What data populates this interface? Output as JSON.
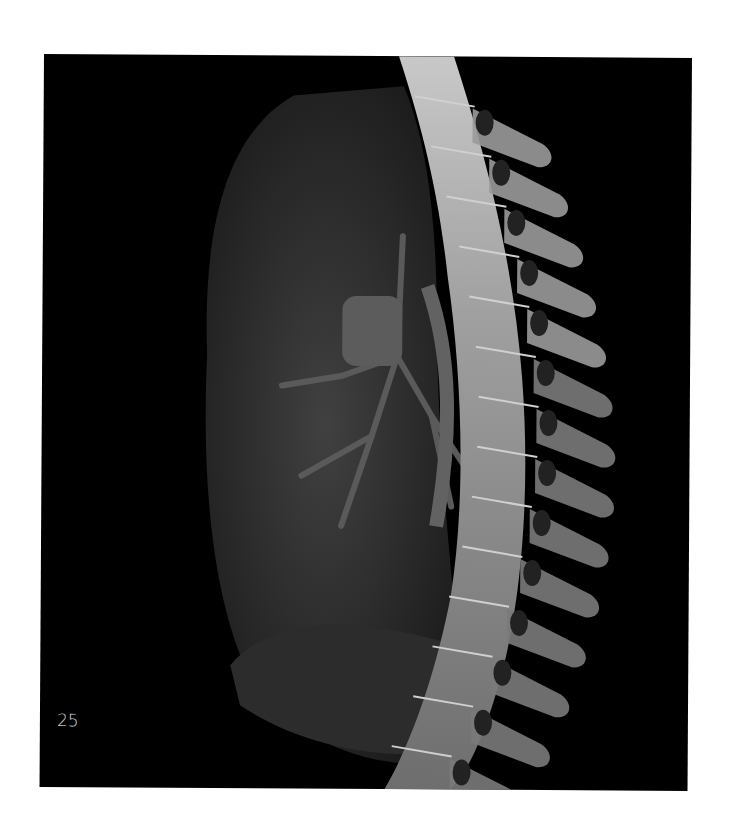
{
  "figure": {
    "page_label": "25",
    "background_color": "#000000",
    "bone_color": "#a8a8a8",
    "lung_color": "#3a3a3a"
  }
}
